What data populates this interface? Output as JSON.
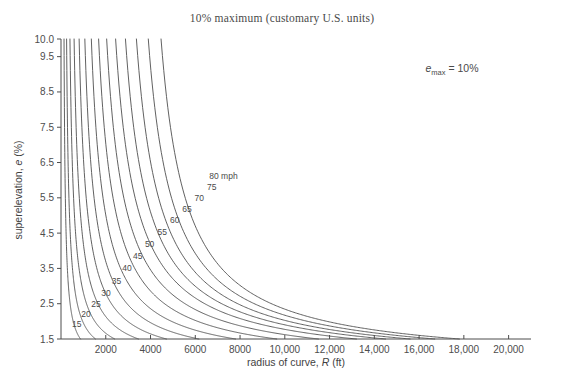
{
  "chart_data": {
    "type": "line",
    "title": "10% maximum (customary U.S. units)",
    "xlabel_parts": {
      "pre": "radius of curve, ",
      "var": "R",
      "post": " (ft)"
    },
    "ylabel_parts": {
      "pre": "superelevation, ",
      "var": "e",
      "post": " (%)"
    },
    "xlabel": "radius of curve, R (ft)",
    "ylabel": "superelevation, e (%)",
    "annotation": {
      "var": "e",
      "sub": "max",
      "rest": " = 10%",
      "text": "emax = 10%"
    },
    "grid": false,
    "legend_position": "inline-curve-labels",
    "xlim": [
      0,
      21000
    ],
    "ylim": [
      1.5,
      10.0
    ],
    "xticks": [
      2000,
      4000,
      6000,
      8000,
      10000,
      12000,
      14000,
      16000,
      18000,
      20000
    ],
    "xtick_labels": [
      "2000",
      "4000",
      "6000",
      "8000",
      "10,000",
      "12,000",
      "14,000",
      "16,000",
      "18,000",
      "20,000"
    ],
    "yticks": [
      1.5,
      2.5,
      3.5,
      4.5,
      5.5,
      6.5,
      7.5,
      8.5,
      9.5,
      10.0
    ],
    "ytick_labels": [
      "1.5",
      "2.5",
      "3.5",
      "4.5",
      "5.5",
      "6.5",
      "7.5",
      "8.5",
      "9.5",
      "10.0"
    ],
    "series": [
      {
        "name": "15",
        "label": "15",
        "label_x": 700,
        "label_y": 1.85,
        "R_at_emax": 135,
        "R_at_emin": 870
      },
      {
        "name": "20",
        "label": "20",
        "label_x": 1120,
        "label_y": 2.12,
        "R_at_emax": 250,
        "R_at_emin": 1540
      },
      {
        "name": "25",
        "label": "25",
        "label_x": 1560,
        "label_y": 2.42,
        "R_at_emax": 400,
        "R_at_emin": 2400
      },
      {
        "name": "30",
        "label": "30",
        "label_x": 2010,
        "label_y": 2.72,
        "R_at_emax": 585,
        "R_at_emin": 3460
      },
      {
        "name": "35",
        "label": "35",
        "label_x": 2480,
        "label_y": 3.06,
        "R_at_emax": 810,
        "R_at_emin": 4710
      },
      {
        "name": "40",
        "label": "40",
        "label_x": 2950,
        "label_y": 3.42,
        "R_at_emax": 1065,
        "R_at_emin": 6160
      },
      {
        "name": "45",
        "label": "45",
        "label_x": 3430,
        "label_y": 3.78,
        "R_at_emax": 1355,
        "R_at_emin": 7800
      },
      {
        "name": "50",
        "label": "50",
        "label_x": 3960,
        "label_y": 4.12,
        "R_at_emax": 1680,
        "R_at_emin": 9640
      },
      {
        "name": "55",
        "label": "55",
        "label_x": 4520,
        "label_y": 4.45,
        "R_at_emax": 2040,
        "R_at_emin": 11500
      },
      {
        "name": "60",
        "label": "60",
        "label_x": 5080,
        "label_y": 4.78,
        "R_at_emax": 2440,
        "R_at_emin": 13200
      },
      {
        "name": "65",
        "label": "65",
        "label_x": 5630,
        "label_y": 5.1,
        "R_at_emax": 2880,
        "R_at_emin": 14500
      },
      {
        "name": "70",
        "label": "70",
        "label_x": 6180,
        "label_y": 5.42,
        "R_at_emax": 3370,
        "R_at_emin": 15600
      },
      {
        "name": "75",
        "label": "75",
        "label_x": 6740,
        "label_y": 5.72,
        "R_at_emax": 3900,
        "R_at_emin": 16700
      },
      {
        "name": "80 mph",
        "label": "80 mph",
        "label_x": 7260,
        "label_y": 6.02,
        "R_at_emax": 4470,
        "R_at_emin": 17800
      }
    ],
    "series_unit": "mph",
    "series_axis_name": "design speed"
  },
  "bottom_caption": ""
}
